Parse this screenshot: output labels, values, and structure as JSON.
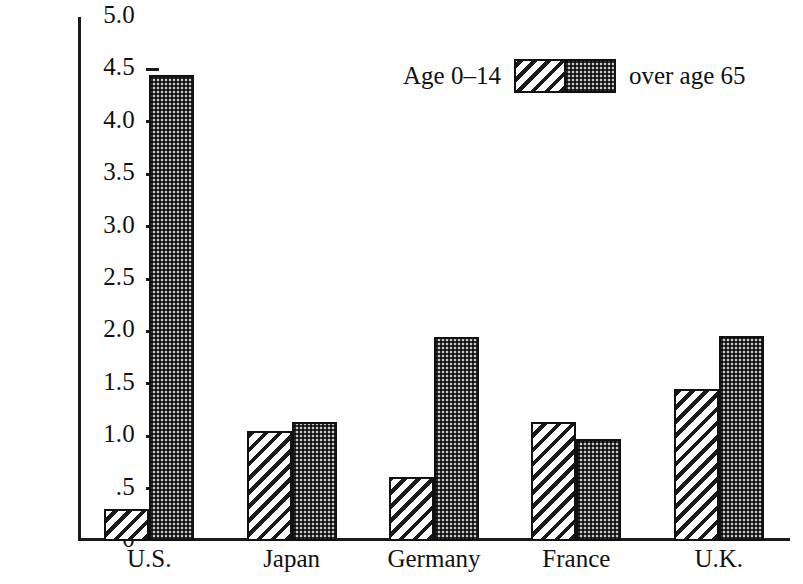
{
  "chart_data": {
    "type": "bar",
    "title": "",
    "subtitle": "",
    "xlabel": "",
    "ylabel": "",
    "categories": [
      "U.S.",
      "Japan",
      "Germany",
      "France",
      "U.K."
    ],
    "series": [
      {
        "name": "Age 0–14",
        "values": [
          0.31,
          1.05,
          0.61,
          1.14,
          1.45
        ],
        "fill": "diagonal-hatch"
      },
      {
        "name": "over age 65",
        "values": [
          4.45,
          1.14,
          1.95,
          0.97,
          1.96
        ],
        "fill": "stipple-dots"
      }
    ],
    "ylim": [
      0,
      5.0
    ],
    "y_ticks": [
      {
        "value": 5.0,
        "label": "5.0"
      },
      {
        "value": 4.5,
        "label": "4.5"
      },
      {
        "value": 4.0,
        "label": "4.0"
      },
      {
        "value": 3.5,
        "label": "3.5"
      },
      {
        "value": 3.0,
        "label": "3.0"
      },
      {
        "value": 2.5,
        "label": "2.5"
      },
      {
        "value": 2.0,
        "label": "2.0"
      },
      {
        "value": 1.5,
        "label": "1.5"
      },
      {
        "value": 1.0,
        "label": "1.0"
      },
      {
        "value": 0.5,
        "label": ".5"
      },
      {
        "value": 0.0,
        "label": "0"
      }
    ],
    "grid": false,
    "legend_position": "top-right-inside",
    "legend": {
      "left_label": "Age 0–14",
      "right_label": "over age 65"
    },
    "colors": {
      "axis": "#1a1a1a",
      "bar_outline": "#111111",
      "hatch": "#1a1a1a",
      "dots_background": "#c9c9c9",
      "background": "#ffffff",
      "text": "#111111"
    }
  }
}
